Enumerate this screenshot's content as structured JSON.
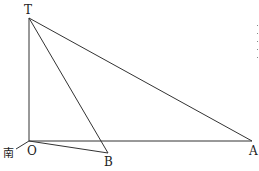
{
  "diagram": {
    "type": "geometry",
    "points": {
      "T": {
        "label": "T",
        "x": 29,
        "y": 18
      },
      "O": {
        "label": "O",
        "x": 29,
        "y": 141
      },
      "B": {
        "label": "B",
        "x": 108,
        "y": 153
      },
      "A": {
        "label": "A",
        "x": 252,
        "y": 141
      }
    },
    "segments": [
      [
        "T",
        "O"
      ],
      [
        "T",
        "A"
      ],
      [
        "T",
        "B"
      ],
      [
        "O",
        "A"
      ],
      [
        "O",
        "B"
      ]
    ],
    "direction_marker": {
      "label": "南",
      "meaning": "south"
    }
  },
  "labels": {
    "T": "T",
    "O": "O",
    "B": "B",
    "A": "A",
    "south": "南"
  },
  "colors": {
    "line": "#333333",
    "text": "#222222",
    "background": "#ffffff"
  }
}
